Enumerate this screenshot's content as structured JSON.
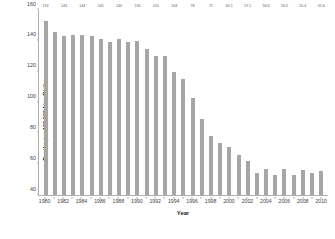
{
  "chart_data": {
    "type": "bar",
    "title": "",
    "xlabel": "Year",
    "ylabel": "Deaths per 100,000 Live Births",
    "ylim": [
      40,
      160
    ],
    "ytick_values": [
      160,
      140,
      120,
      100,
      80,
      60,
      40
    ],
    "ytick_labels": [
      "160",
      "140",
      "120",
      "100",
      "80",
      "60",
      "40"
    ],
    "grid": false,
    "legend": false,
    "bar_color": "#a6a6a6",
    "axis_color": "#b0b0b0",
    "categories": [
      "1980",
      "1981",
      "1982",
      "1983",
      "1984",
      "1985",
      "1986",
      "1987",
      "1988",
      "1989",
      "1990",
      "1991",
      "1992",
      "1993",
      "1994",
      "1995",
      "1996",
      "1997",
      "1998",
      "1999",
      "2000",
      "2001",
      "2002",
      "2003",
      "2004",
      "2005",
      "2006",
      "2007",
      "2008",
      "2009",
      "2010"
    ],
    "xtick_labels": [
      "1980",
      "",
      "1982",
      "",
      "1984",
      "",
      "1986",
      "",
      "1988",
      "",
      "1990",
      "",
      "1992",
      "",
      "1994",
      "",
      "1996",
      "",
      "1998",
      "",
      "2000",
      "",
      "2002",
      "",
      "2004",
      "",
      "2006",
      "",
      "2008",
      "",
      "2010"
    ],
    "values": [
      153,
      146,
      143,
      144,
      144,
      143,
      141,
      139,
      141,
      139,
      140,
      135,
      130,
      130,
      120,
      115,
      103,
      89,
      78,
      74,
      71,
      66,
      62.1,
      54,
      57.1,
      53,
      56.6,
      53,
      56.5,
      54,
      55.4
    ],
    "point_labels": [
      "153",
      "",
      "143",
      "",
      "144",
      "",
      "141",
      "",
      "140",
      "",
      "130",
      "",
      "120",
      "",
      "103",
      "",
      "78",
      "",
      "71",
      "",
      "62.1",
      "",
      "57.1",
      "",
      "56.6",
      "",
      "56.5",
      "",
      "55.4",
      "",
      "51.6"
    ],
    "labeled_values": [
      {
        "year": "1980",
        "value": 153,
        "label": "153"
      },
      {
        "year": "1982",
        "value": 143,
        "label": "143"
      },
      {
        "year": "1984",
        "value": 144,
        "label": "144"
      },
      {
        "year": "1986",
        "value": 141,
        "label": "141"
      },
      {
        "year": "1988",
        "value": 140,
        "label": "140"
      },
      {
        "year": "1990",
        "value": 130,
        "label": "130"
      },
      {
        "year": "1992",
        "value": 120,
        "label": "120"
      },
      {
        "year": "1994",
        "value": 103,
        "label": "103"
      },
      {
        "year": "1996",
        "value": 78,
        "label": "78"
      },
      {
        "year": "1998",
        "value": 71,
        "label": "71"
      },
      {
        "year": "2000",
        "value": 62.1,
        "label": "62.1"
      },
      {
        "year": "2002",
        "value": 57.1,
        "label": "57.1"
      },
      {
        "year": "2004",
        "value": 56.6,
        "label": "56.6"
      },
      {
        "year": "2006",
        "value": 56.5,
        "label": "56.5"
      },
      {
        "year": "2008",
        "value": 55.4,
        "label": "55.4"
      },
      {
        "year": "2010",
        "value": 51.6,
        "label": "51.6"
      }
    ]
  }
}
